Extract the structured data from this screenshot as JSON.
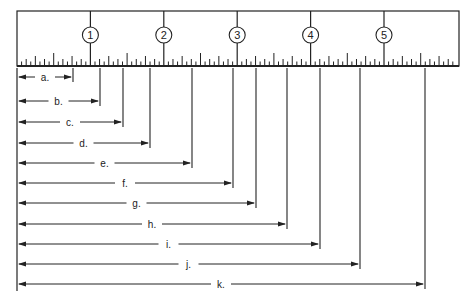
{
  "diagram": {
    "type": "ruler-measurement-exercise",
    "ruler": {
      "unit_label": "inch",
      "subdivisions_per_unit": 16,
      "markers": [
        "1",
        "2",
        "3",
        "4",
        "5"
      ],
      "left_px": 17,
      "right_px": 459,
      "top_px": 11,
      "bottom_px": 66,
      "unit_px": 73.4
    },
    "measurements": [
      {
        "label": "a.",
        "end_x": 73,
        "y": 77
      },
      {
        "label": "b.",
        "end_x": 100,
        "y": 101
      },
      {
        "label": "c.",
        "end_x": 123,
        "y": 122
      },
      {
        "label": "d.",
        "end_x": 150,
        "y": 143
      },
      {
        "label": "e.",
        "end_x": 192,
        "y": 163
      },
      {
        "label": "f.",
        "end_x": 233,
        "y": 183
      },
      {
        "label": "g.",
        "end_x": 256,
        "y": 203
      },
      {
        "label": "h.",
        "end_x": 287,
        "y": 224
      },
      {
        "label": "i.",
        "end_x": 320,
        "y": 244
      },
      {
        "label": "j.",
        "end_x": 360,
        "y": 264
      },
      {
        "label": "k.",
        "end_x": 425,
        "y": 284
      }
    ],
    "colors": {
      "ink": "#222222",
      "background": "#ffffff"
    }
  }
}
